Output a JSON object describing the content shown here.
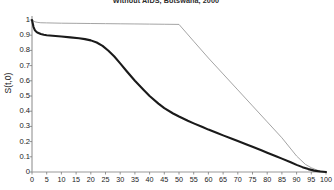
{
  "chart_data": {
    "type": "line",
    "title": "Without AIDS, Botswana, 2000",
    "xlabel": "",
    "ylabel": "S(t,0)",
    "xlim": [
      0,
      100
    ],
    "ylim": [
      0,
      1
    ],
    "grid": false,
    "legend": "none",
    "xticks": [
      0,
      5,
      10,
      15,
      20,
      25,
      30,
      35,
      40,
      45,
      50,
      55,
      60,
      65,
      70,
      75,
      80,
      85,
      90,
      95,
      100
    ],
    "yticks": [
      0,
      0.1,
      0.2,
      0.3,
      0.4,
      0.5,
      0.6,
      0.7,
      0.8,
      0.9,
      1
    ],
    "ytick_labels": [
      "0",
      "0.1",
      "0.2",
      "0.3",
      "0.4",
      "0.5",
      "0.6",
      "0.7",
      "0.8",
      "0.9",
      "1"
    ],
    "series": [
      {
        "name": "without-aids-survival",
        "style": "thin-gray",
        "color": "#9a9a9a",
        "width": 0.9,
        "x": [
          0,
          1,
          2,
          3,
          5,
          10,
          15,
          20,
          25,
          30,
          35,
          40,
          45,
          50,
          55,
          60,
          65,
          70,
          75,
          80,
          85,
          90,
          93,
          95,
          97,
          100
        ],
        "y": [
          1.0,
          0.988,
          0.984,
          0.982,
          0.981,
          0.979,
          0.978,
          0.977,
          0.976,
          0.975,
          0.974,
          0.973,
          0.972,
          0.971,
          0.86,
          0.75,
          0.645,
          0.54,
          0.435,
          0.33,
          0.225,
          0.105,
          0.05,
          0.028,
          0.012,
          0.0
        ]
      },
      {
        "name": "with-aids-survival",
        "style": "thick-black",
        "color": "#1a1a1a",
        "width": 2.1,
        "x": [
          0,
          0.5,
          1,
          1.5,
          2,
          3,
          4,
          5,
          7,
          10,
          13,
          16,
          18,
          20,
          22,
          24,
          26,
          28,
          30,
          32,
          35,
          38,
          40,
          43,
          45,
          48,
          50,
          53,
          55,
          58,
          60,
          63,
          65,
          68,
          70,
          73,
          75,
          78,
          80,
          83,
          85,
          88,
          90,
          92,
          94,
          96,
          98,
          100
        ],
        "y": [
          1.0,
          0.955,
          0.932,
          0.922,
          0.916,
          0.908,
          0.903,
          0.9,
          0.896,
          0.891,
          0.886,
          0.88,
          0.874,
          0.866,
          0.852,
          0.83,
          0.798,
          0.76,
          0.715,
          0.668,
          0.6,
          0.54,
          0.5,
          0.45,
          0.42,
          0.385,
          0.365,
          0.337,
          0.32,
          0.296,
          0.279,
          0.256,
          0.241,
          0.219,
          0.204,
          0.181,
          0.166,
          0.143,
          0.127,
          0.104,
          0.088,
          0.064,
          0.047,
          0.032,
          0.019,
          0.009,
          0.003,
          0.0
        ]
      }
    ]
  }
}
